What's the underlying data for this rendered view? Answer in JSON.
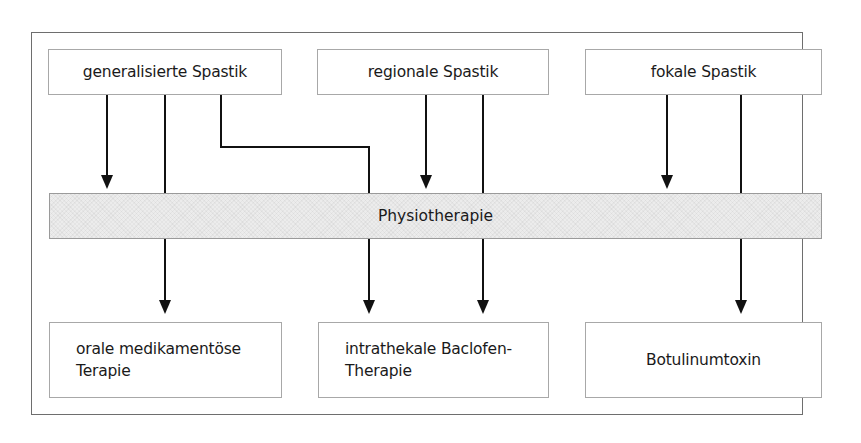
{
  "diagram": {
    "type": "flowchart",
    "top_row": [
      {
        "id": "generalisiert",
        "label": "generalisierte Spastik"
      },
      {
        "id": "regional",
        "label": "regionale Spastik"
      },
      {
        "id": "fokal",
        "label": "fokale Spastik"
      }
    ],
    "middle_bar": {
      "id": "physio",
      "label": "Physiotherapie"
    },
    "bottom_row": [
      {
        "id": "oral",
        "line1": "orale medikamentöse",
        "line2": "Terapie"
      },
      {
        "id": "itb",
        "line1": "intrathekale Baclofen-",
        "line2": "Therapie"
      },
      {
        "id": "botox",
        "line1": "Botulinumtoxin"
      }
    ],
    "edges": [
      {
        "from": "generalisiert",
        "to": "physio"
      },
      {
        "from": "generalisiert",
        "to": "oral"
      },
      {
        "from": "generalisiert",
        "to": "itb"
      },
      {
        "from": "regional",
        "to": "physio"
      },
      {
        "from": "regional",
        "to": "itb"
      },
      {
        "from": "fokal",
        "to": "physio"
      },
      {
        "from": "fokal",
        "to": "botox"
      }
    ],
    "colors": {
      "line": "#111111",
      "box_border": "#a8a8a8",
      "bar_fill": "#ececec",
      "frame": "#6e6e6e"
    }
  }
}
